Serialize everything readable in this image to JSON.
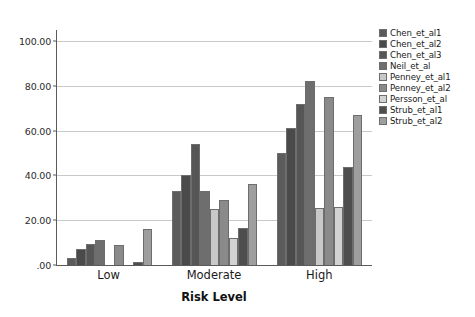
{
  "chart_data": {
    "type": "bar",
    "title": "",
    "xlabel": "Risk Level",
    "ylabel": "",
    "categories": [
      "Low",
      "Moderate",
      "High"
    ],
    "ylim": [
      0,
      105
    ],
    "yticks": [
      0,
      20,
      40,
      60,
      80,
      100
    ],
    "ytick_labels": [
      ".00",
      "20.00",
      "40.00",
      "60.00",
      "80.00",
      "100.00"
    ],
    "grid": true,
    "legend_position": "right",
    "series": [
      {
        "name": "Chen_et_al1",
        "color": "#5b5b5b",
        "values": [
          3.0,
          33.0,
          50.0
        ]
      },
      {
        "name": "Chen_et_al2",
        "color": "#4a4a4a",
        "values": [
          7.0,
          40.0,
          61.0
        ]
      },
      {
        "name": "Chen_et_al3",
        "color": "#565656",
        "values": [
          9.5,
          54.0,
          72.0
        ]
      },
      {
        "name": "Neil_et_al",
        "color": "#6e6e6e",
        "values": [
          11.0,
          33.0,
          82.0
        ]
      },
      {
        "name": "Penney_et_al1",
        "color": "#c8c8c8",
        "values": [
          0.0,
          25.0,
          25.5
        ]
      },
      {
        "name": "Penney_et_al2",
        "color": "#8a8a8a",
        "values": [
          9.0,
          29.0,
          75.0
        ]
      },
      {
        "name": "Persson_et_al",
        "color": "#d2d2d2",
        "values": [
          0.0,
          12.0,
          26.0
        ]
      },
      {
        "name": "Strub_et_al1",
        "color": "#4e4e4e",
        "values": [
          1.5,
          16.5,
          44.0
        ]
      },
      {
        "name": "Strub_et_al2",
        "color": "#9e9e9e",
        "values": [
          16.0,
          36.0,
          67.0
        ]
      }
    ]
  }
}
